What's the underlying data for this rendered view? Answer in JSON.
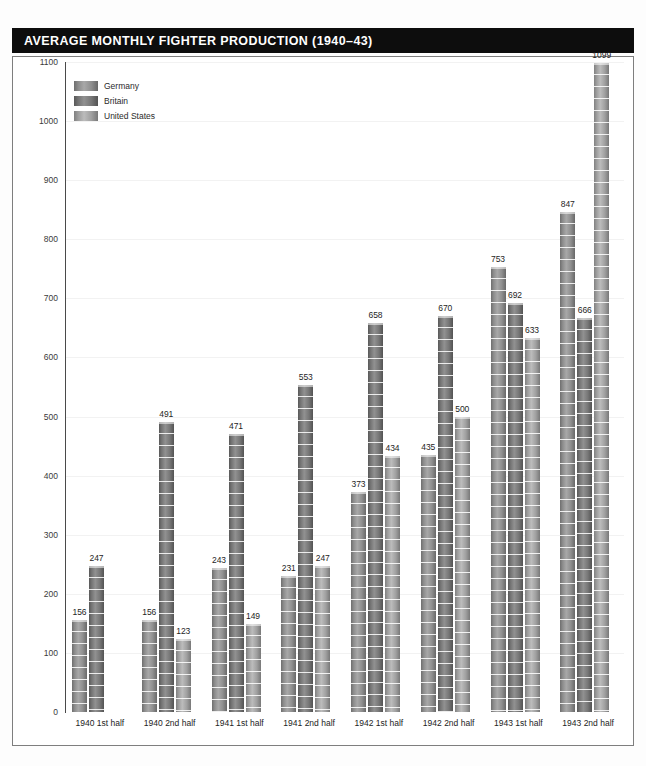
{
  "header": {
    "title": "AVERAGE MONTHLY FIGHTER PRODUCTION (1940–43)",
    "background_color": "#0d0d0d",
    "text_color": "#ffffff"
  },
  "legend": {
    "position": "top-left-inside-plot",
    "items": [
      {
        "label": "Germany",
        "color": "#8d8d8d",
        "key": "germany"
      },
      {
        "label": "Britain",
        "color": "#6f6f6f",
        "key": "britain"
      },
      {
        "label": "United States",
        "color": "#b0b0b0",
        "key": "united_states"
      }
    ]
  },
  "chart_data": {
    "type": "bar",
    "title": "AVERAGE MONTHLY FIGHTER PRODUCTION (1940–43)",
    "xlabel": "",
    "ylabel": "",
    "ylim": [
      0,
      1100
    ],
    "ytick_step": 100,
    "ytick_labels": [
      "0",
      "100",
      "200",
      "300",
      "400",
      "500",
      "600",
      "700",
      "800",
      "900",
      "1000",
      "1100"
    ],
    "grid": true,
    "legend_position": "upper left",
    "categories": [
      "1940 1st half",
      "1940 2nd half",
      "1941 1st half",
      "1941 2nd half",
      "1942 1st half",
      "1942 2nd half",
      "1943 1st half",
      "1943 2nd half"
    ],
    "series": [
      {
        "name": "Germany",
        "color": "#8d8d8d",
        "values": [
          156,
          156,
          243,
          231,
          373,
          435,
          753,
          847
        ]
      },
      {
        "name": "Britain",
        "color": "#6f6f6f",
        "values": [
          247,
          491,
          471,
          553,
          658,
          670,
          692,
          666
        ]
      },
      {
        "name": "United States",
        "color": "#b0b0b0",
        "values": [
          null,
          123,
          149,
          247,
          434,
          500,
          633,
          1099
        ]
      }
    ]
  }
}
